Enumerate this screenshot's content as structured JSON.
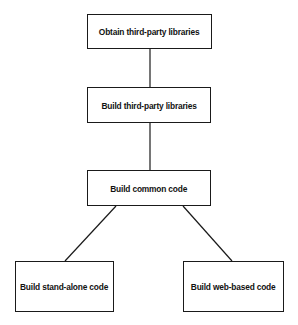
{
  "diagram": {
    "type": "flowchart",
    "colors": {
      "stroke": "#1a1a1a",
      "text": "#111111",
      "background": "#ffffff"
    },
    "nodes": [
      {
        "id": "obtain",
        "label": "Obtain third-party libraries",
        "x": 87,
        "y": 14,
        "w": 125,
        "h": 35
      },
      {
        "id": "build-third",
        "label": "Build third-party libraries",
        "x": 87,
        "y": 87,
        "w": 124,
        "h": 36
      },
      {
        "id": "build-common",
        "label": "Build common code",
        "x": 87,
        "y": 170,
        "w": 124,
        "h": 36
      },
      {
        "id": "build-standalone",
        "label": "Build stand-alone code",
        "x": 15,
        "y": 261,
        "w": 99,
        "h": 51
      },
      {
        "id": "build-web",
        "label": "Build web-based code",
        "x": 183,
        "y": 261,
        "w": 101,
        "h": 51
      }
    ],
    "edges": [
      {
        "from": "obtain",
        "to": "build-third",
        "x1": 150,
        "y1": 49,
        "x2": 150,
        "y2": 87
      },
      {
        "from": "build-third",
        "to": "build-common",
        "x1": 150,
        "y1": 123,
        "x2": 150,
        "y2": 170
      },
      {
        "from": "build-common",
        "to": "build-standalone",
        "x1": 116,
        "y1": 206,
        "x2": 65,
        "y2": 261
      },
      {
        "from": "build-common",
        "to": "build-web",
        "x1": 183,
        "y1": 206,
        "x2": 232,
        "y2": 261
      }
    ]
  }
}
